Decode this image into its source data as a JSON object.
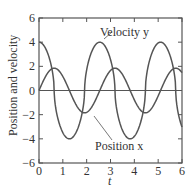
{
  "chart_data": {
    "type": "line",
    "title": "",
    "xlabel": "t",
    "ylabel": "Position and velocity",
    "xlim": [
      0,
      6
    ],
    "ylim": [
      -6,
      6
    ],
    "xticks": [
      "0",
      "1",
      "2",
      "3",
      "4",
      "5",
      "6"
    ],
    "yticks": [
      "6",
      "4",
      "2",
      "0",
      "-2",
      "-4",
      "-6"
    ],
    "grid": false,
    "series": [
      {
        "name": "Velocity y",
        "label": "Velocity y",
        "period": 2.55,
        "amplitude": 4.0,
        "x": [
          0,
          0.3,
          0.64,
          1.0,
          1.28,
          1.6,
          1.91,
          2.25,
          2.55,
          2.85,
          3.19,
          3.55,
          3.83,
          4.15,
          4.46,
          4.8,
          5.1,
          5.4,
          5.74,
          6.0
        ],
        "y": [
          4.0,
          3.5,
          0.0,
          -3.5,
          -4.0,
          -3.5,
          0.0,
          3.5,
          4.0,
          3.5,
          0.0,
          -3.5,
          -4.0,
          -3.5,
          0.0,
          3.5,
          4.0,
          3.5,
          0.0,
          -3.3
        ]
      },
      {
        "name": "Position x",
        "label": "Position x",
        "x": [
          0,
          0.32,
          0.64,
          1.0,
          1.28,
          1.6,
          1.91,
          2.25,
          2.55,
          2.9,
          3.19,
          3.55,
          3.83,
          4.15,
          4.46,
          4.8,
          5.1,
          5.45,
          5.74,
          6.0
        ],
        "y": [
          0.0,
          1.4,
          1.85,
          1.4,
          0.0,
          -1.4,
          -1.85,
          -1.4,
          0.0,
          1.4,
          1.85,
          1.4,
          0.0,
          -1.4,
          -1.85,
          -1.4,
          0.0,
          1.4,
          1.85,
          1.6
        ]
      }
    ],
    "annotations": [
      "Velocity y",
      "Position x"
    ]
  }
}
